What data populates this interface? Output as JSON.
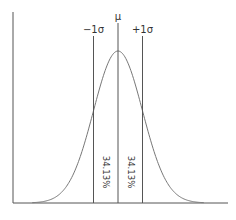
{
  "chart_data": {
    "type": "line",
    "title": "",
    "xlabel": "",
    "ylabel": "",
    "grid": false,
    "distribution": {
      "mean": 0,
      "sd": 1,
      "x_range": [
        -3.5,
        3.5
      ]
    },
    "markers": [
      {
        "label": "−1σ",
        "x": -1
      },
      {
        "label": "μ",
        "x": 0
      },
      {
        "label": "+1σ",
        "x": 1
      }
    ],
    "region_labels": [
      {
        "label": "34.13%",
        "from": -1,
        "to": 0
      },
      {
        "label": "34.13%",
        "from": 0,
        "to": 1
      }
    ]
  }
}
